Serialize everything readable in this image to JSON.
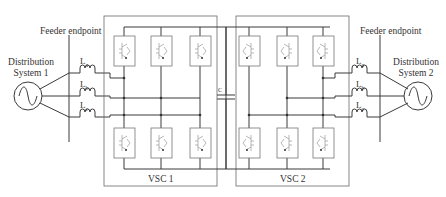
{
  "diagram": {
    "feeder_left_label": "Feeder endpoint",
    "feeder_right_label": "Feeder endpoint",
    "ds1_line1": "Distribution",
    "ds1_line2": "System 1",
    "ds2_line1": "Distribution",
    "ds2_line2": "System 2",
    "inductors_left": [
      {
        "base": "L",
        "sub": "a"
      },
      {
        "base": "L",
        "sub": "b"
      },
      {
        "base": "L",
        "sub": "c"
      }
    ],
    "inductors_right": [
      {
        "base": "L",
        "sub": "a"
      },
      {
        "base": "L",
        "sub": "b"
      },
      {
        "base": "L",
        "sub": "c"
      }
    ],
    "capacitor_label": "C",
    "vsc1_label": "VSC 1",
    "vsc2_label": "VSC 2",
    "line_color": "#3a3a3a",
    "box_color": "#6a6a6a"
  }
}
